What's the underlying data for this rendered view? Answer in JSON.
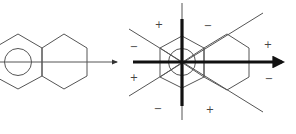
{
  "figure": {
    "left_panel": {
      "description": "naphthalene-like fused rings with thin horizontal arrow",
      "arrow": {
        "x1": 0,
        "y1": 62,
        "x2": 117,
        "y2": 62
      }
    },
    "right_panel": {
      "description": "fused rings with thick orthogonal axes and nodal diagonal lines",
      "signs": [
        {
          "label": "+",
          "x": 159,
          "y": 24
        },
        {
          "label": "−",
          "x": 208,
          "y": 25
        },
        {
          "label": "−",
          "x": 134,
          "y": 46
        },
        {
          "label": "+",
          "x": 268,
          "y": 44
        },
        {
          "label": "+",
          "x": 134,
          "y": 77
        },
        {
          "label": "−",
          "x": 269,
          "y": 78
        },
        {
          "label": "−",
          "x": 158,
          "y": 108
        },
        {
          "label": "+",
          "x": 210,
          "y": 109
        }
      ]
    },
    "colors": {
      "line": "#555555",
      "thick": "#111111",
      "background": "#ffffff"
    }
  }
}
